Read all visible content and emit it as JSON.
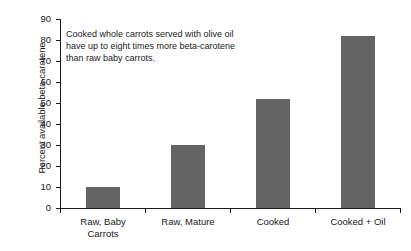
{
  "chart_data": {
    "type": "bar",
    "title": "",
    "xlabel": "",
    "ylabel": "Percent available beta-carotene",
    "categories": [
      "Raw, Baby\nCarrots",
      "Raw, Mature",
      "Cooked",
      "Cooked + Oil"
    ],
    "values": [
      10,
      30,
      52,
      82
    ],
    "ylim": [
      0,
      90
    ],
    "yticks": [
      0,
      10,
      20,
      30,
      40,
      50,
      60,
      70,
      80,
      90
    ],
    "ytick_labels": [
      "0",
      "10",
      "20",
      "30",
      "40",
      "50",
      "60",
      "70",
      "80",
      "90"
    ],
    "grid": false,
    "legend": null,
    "bar_color": "#646464",
    "axis_color": "#1a1a1a",
    "background": "#ffffff",
    "annotations": [
      {
        "text": "Cooked whole carrots served with olive oil\nhave up to eight times more beta-carotene\nthan raw baby carrots."
      }
    ]
  }
}
